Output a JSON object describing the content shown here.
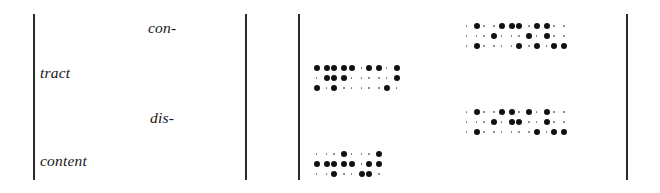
{
  "figure": {
    "background_color": "#ffffff",
    "ink_color": "#111111",
    "rule_color": "#2b2b2b"
  },
  "rules": [
    {
      "name": "rule-left",
      "x": 33
    },
    {
      "name": "rule-second",
      "x": 245
    },
    {
      "name": "rule-third",
      "x": 298
    },
    {
      "name": "rule-right",
      "x": 626
    }
  ],
  "words": [
    {
      "id": "con",
      "text": "con-"
    },
    {
      "id": "tract",
      "text": "tract"
    },
    {
      "id": "dis",
      "text": "dis-"
    },
    {
      "id": "content",
      "text": "content"
    }
  ],
  "braille_groups": [
    {
      "id": "group-con-tract-right",
      "row": "top",
      "column": "right",
      "cell_count": 6,
      "cells": [
        {
          "dots": [
            4,
            6
          ]
        },
        {
          "dots": [
            5
          ]
        },
        {
          "dots": [
            1,
            4
          ]
        },
        {
          "dots": [
            1,
            5,
            3
          ]
        },
        {
          "dots": [
            1,
            4,
            5,
            3
          ]
        },
        {
          "dots": [
            3,
            6
          ]
        }
      ]
    },
    {
      "id": "group-con-tract-left",
      "row": "upper-middle",
      "column": "left",
      "cell_count": 5,
      "cells": [
        {
          "dots": [
            4,
            1,
            5,
            3
          ]
        },
        {
          "dots": [
            1,
            4,
            2,
            5,
            3
          ]
        },
        {
          "dots": [
            1
          ]
        },
        {
          "dots": [
            1,
            4
          ]
        },
        {
          "dots": [
            4,
            5,
            3
          ]
        }
      ]
    },
    {
      "id": "group-dis-content-right",
      "row": "lower-middle",
      "column": "right",
      "cell_count": 6,
      "cells": [
        {
          "dots": [
            4,
            6
          ]
        },
        {
          "dots": [
            5
          ]
        },
        {
          "dots": [
            1,
            4,
            5
          ]
        },
        {
          "dots": [
            4,
            2
          ]
        },
        {
          "dots": [
            4,
            5,
            3
          ]
        },
        {
          "dots": [
            3,
            6
          ]
        }
      ]
    },
    {
      "id": "group-dis-content-left",
      "row": "bottom",
      "column": "left",
      "cell_count": 4,
      "cells": [
        {
          "dots": [
            2,
            5
          ]
        },
        {
          "dots": [
            4,
            2,
            5,
            3
          ]
        },
        {
          "dots": [
            2,
            6
          ]
        },
        {
          "dots": [
            4,
            2,
            5,
            3
          ]
        }
      ]
    }
  ]
}
